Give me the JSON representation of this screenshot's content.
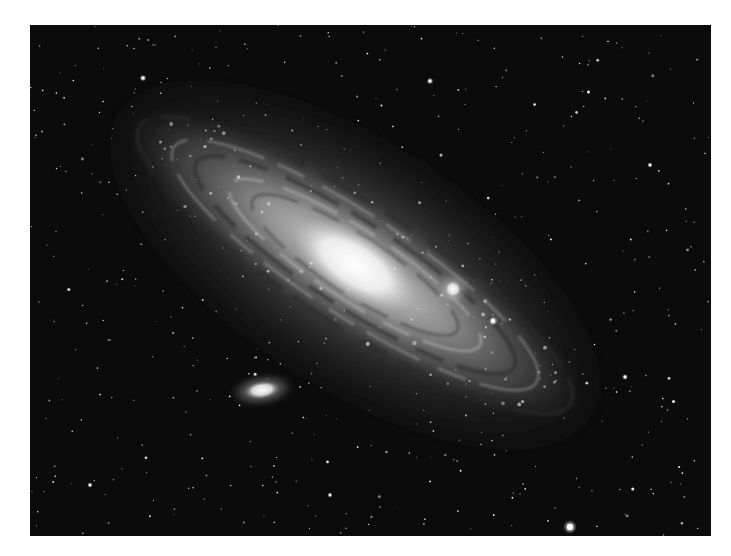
{
  "image": {
    "subject": "Spiral galaxy with two satellite galaxies",
    "tone": "grayscale",
    "frame": {
      "x": 30,
      "y": 25,
      "width": 681,
      "height": 511,
      "background": "#0b0b0b",
      "border_color": "#ffffff"
    }
  },
  "galaxy": {
    "center": [
      325,
      240
    ],
    "angle_deg": 33,
    "disk": {
      "rx": 270,
      "ry": 70
    },
    "core": {
      "rx": 70,
      "ry": 32
    },
    "colors": {
      "core": "#f4f4f4",
      "mid": "#9a9a9a",
      "halo": "#3a3a3a"
    }
  },
  "satellites": [
    {
      "name": "satellite-elliptical-lower",
      "cx": 232,
      "cy": 365,
      "rx": 18,
      "ry": 9,
      "angle_deg": -8
    },
    {
      "name": "satellite-compact-upper",
      "cx": 423,
      "cy": 264,
      "rx": 9,
      "ry": 9,
      "angle_deg": 0
    }
  ],
  "bright_stars": [
    {
      "cx": 540,
      "cy": 502,
      "r": 3.2
    },
    {
      "cx": 463,
      "cy": 296,
      "r": 2.2
    },
    {
      "cx": 400,
      "cy": 56,
      "r": 1.6
    },
    {
      "cx": 113,
      "cy": 53,
      "r": 1.6
    },
    {
      "cx": 595,
      "cy": 352,
      "r": 1.4
    },
    {
      "cx": 620,
      "cy": 140,
      "r": 1.3
    },
    {
      "cx": 60,
      "cy": 460,
      "r": 1.3
    },
    {
      "cx": 300,
      "cy": 470,
      "r": 1.2
    }
  ],
  "star_field": {
    "count": 520,
    "seed": 7
  }
}
